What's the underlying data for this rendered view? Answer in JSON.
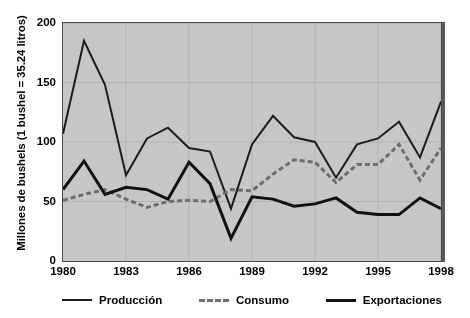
{
  "chart_data": {
    "type": "line",
    "title": "",
    "xlabel": "",
    "ylabel": "Millones de bushels (1 bushel = 35.24 litros)",
    "xlim": [
      1980,
      1998
    ],
    "ylim": [
      0,
      200
    ],
    "y_ticks": [
      "0",
      "50",
      "100",
      "150",
      "200"
    ],
    "y_tick_values": [
      0,
      50,
      100,
      150,
      200
    ],
    "x_ticks": [
      "1980",
      "1983",
      "1986",
      "1989",
      "1992",
      "1995",
      "1998"
    ],
    "x_tick_values": [
      1980,
      1983,
      1986,
      1989,
      1992,
      1995,
      1998
    ],
    "grid": true,
    "legend_position": "bottom",
    "x": [
      1980,
      1981,
      1982,
      1983,
      1984,
      1985,
      1986,
      1987,
      1988,
      1989,
      1990,
      1991,
      1992,
      1993,
      1994,
      1995,
      1996,
      1997,
      1998
    ],
    "series": [
      {
        "name": "Producción",
        "style": "solid",
        "color": "#1c1c1c",
        "width": 2,
        "values": [
          107,
          185,
          148,
          72,
          103,
          112,
          95,
          92,
          44,
          98,
          122,
          104,
          100,
          70,
          98,
          103,
          117,
          87,
          134
        ]
      },
      {
        "name": "Consumo",
        "style": "dashed",
        "color": "#6e6e6e",
        "width": 3,
        "values": [
          51,
          56,
          60,
          52,
          45,
          50,
          51,
          50,
          60,
          59,
          73,
          85,
          83,
          66,
          81,
          81,
          98,
          68,
          95
        ]
      },
      {
        "name": "Exportaciones",
        "style": "solid",
        "color": "#111111",
        "width": 3,
        "values": [
          60,
          84,
          56,
          62,
          60,
          52,
          83,
          65,
          19,
          54,
          52,
          46,
          48,
          53,
          41,
          39,
          39,
          53,
          44
        ]
      }
    ]
  },
  "legend": {
    "items": [
      {
        "label": "Producción",
        "style": "solid",
        "color": "#1c1c1c",
        "width": 2
      },
      {
        "label": "Consumo",
        "style": "dashed",
        "color": "#6e6e6e",
        "width": 3
      },
      {
        "label": "Exportaciones",
        "style": "solid",
        "color": "#111111",
        "width": 3
      }
    ]
  },
  "colors": {
    "plot_background": "#c9c9c9",
    "page_background": "#ffffff",
    "axis": "#4a4a4a",
    "text": "#000000",
    "gridline": "#b4b4b4"
  }
}
